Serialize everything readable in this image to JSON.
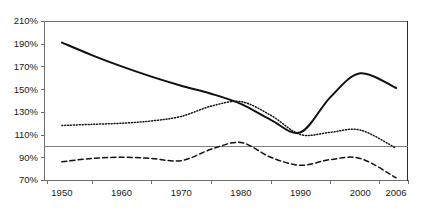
{
  "chart_data": {
    "type": "line",
    "title": "",
    "subtitle": "",
    "xlabel": "",
    "ylabel": "",
    "xlim": [
      1947,
      2008
    ],
    "ylim": [
      70,
      210
    ],
    "y_tick_labels": [
      "210%",
      "190%",
      "170%",
      "150%",
      "130%",
      "110%",
      "90%",
      "70%"
    ],
    "y_ticks": [
      210,
      190,
      170,
      150,
      130,
      110,
      90,
      70
    ],
    "x_tick_labels": [
      "1950",
      "1960",
      "1970",
      "1980",
      "1990",
      "2000",
      "2006"
    ],
    "x_ticks": [
      1950,
      1960,
      1970,
      1980,
      1990,
      2000,
      2006
    ],
    "grid": false,
    "legend": "none",
    "reference_lines": [
      {
        "name": "baseline-100",
        "value": 100,
        "orientation": "horizontal",
        "color": "#808080"
      }
    ],
    "x": [
      1950,
      1955,
      1960,
      1965,
      1970,
      1975,
      1980,
      1985,
      1990,
      1995,
      2000,
      2006
    ],
    "series": [
      {
        "name": "series-solid",
        "style": "solid",
        "color": "#111111",
        "values": [
          191,
          180,
          170,
          161,
          153,
          146,
          137,
          123,
          112,
          143,
          164,
          151
        ]
      },
      {
        "name": "series-dotted",
        "style": "dotted",
        "color": "#111111",
        "values": [
          118,
          119,
          120,
          122,
          126,
          135,
          139,
          127,
          110,
          112,
          114,
          98
        ]
      },
      {
        "name": "series-dashed",
        "style": "dashed",
        "color": "#111111",
        "values": [
          86,
          89,
          90,
          89,
          87,
          97,
          103,
          90,
          83,
          88,
          89,
          72
        ]
      }
    ]
  }
}
